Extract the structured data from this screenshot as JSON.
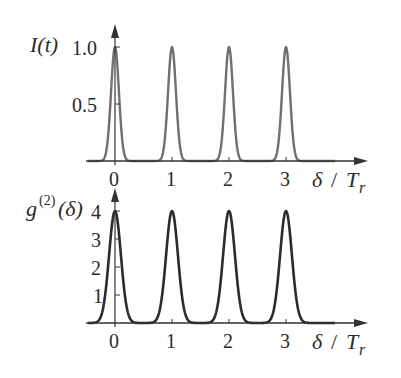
{
  "chart_data": [
    {
      "type": "line",
      "title": "",
      "ylabel": "I(t)",
      "xlabel": "δ / T_r",
      "xticks": [
        "0",
        "1",
        "2",
        "3"
      ],
      "yticks": [
        "0.5",
        "1.0"
      ],
      "ylim": [
        0,
        1.1
      ],
      "xlim": [
        -0.6,
        4.4
      ],
      "grid": false,
      "legend": null,
      "peak_centers": [
        0,
        1,
        2,
        3
      ],
      "peak_height": 1.0,
      "peak_halfwidth_at_base": 0.18,
      "series": [
        {
          "name": "I(t)",
          "color": "#6e6e6e",
          "x": [
            0,
            1,
            2,
            3
          ],
          "values": [
            1.0,
            1.0,
            1.0,
            1.0
          ]
        }
      ]
    },
    {
      "type": "line",
      "title": "",
      "ylabel": "g(2)(δ)",
      "xlabel": "δ / T_r",
      "xticks": [
        "0",
        "1",
        "2",
        "3"
      ],
      "yticks": [
        "1",
        "2",
        "3",
        "4"
      ],
      "ylim": [
        0,
        4.3
      ],
      "xlim": [
        -0.6,
        4.4
      ],
      "grid": false,
      "legend": null,
      "peak_centers": [
        0,
        1,
        2,
        3
      ],
      "peak_height": 4.0,
      "peak_halfwidth_at_base": 0.27,
      "series": [
        {
          "name": "g(2)(δ)",
          "color": "#2b2b2b",
          "x": [
            0,
            1,
            2,
            3
          ],
          "values": [
            4,
            4,
            4,
            4
          ]
        }
      ]
    }
  ],
  "labels": {
    "top_ylabel_main": "I(t)",
    "bottom_ylabel_g": "g",
    "bottom_ylabel_sup": "(2)",
    "bottom_ylabel_arg": "(δ)",
    "xlabel_delta": "δ",
    "xlabel_slash": "/",
    "xlabel_T": "T",
    "xlabel_sub": "r",
    "top_yticks": [
      "1.0",
      "0.5"
    ],
    "bottom_yticks": [
      "4",
      "3",
      "2",
      "1"
    ],
    "xticks": [
      "0",
      "1",
      "2",
      "3"
    ]
  }
}
